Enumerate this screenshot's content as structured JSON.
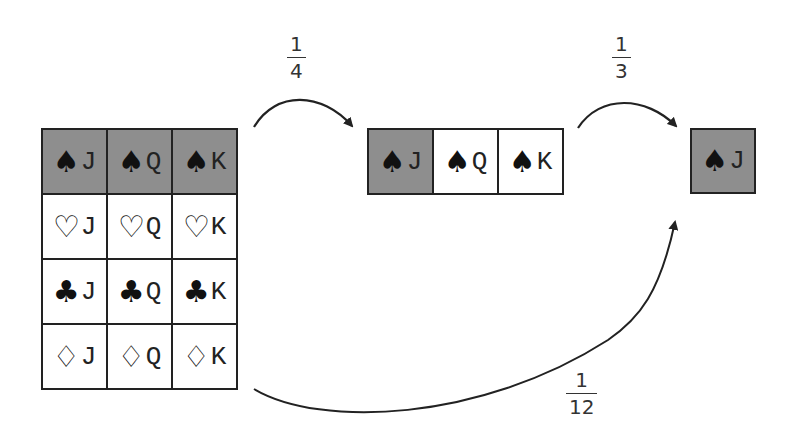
{
  "colors": {
    "highlight": "#8e8e8e",
    "border": "#222222",
    "background": "#ffffff",
    "arrow": "#222222"
  },
  "full_grid": {
    "rows": [
      [
        {
          "suit": "♠",
          "rank": "J",
          "highlight": true
        },
        {
          "suit": "♠",
          "rank": "Q",
          "highlight": true
        },
        {
          "suit": "♠",
          "rank": "K",
          "highlight": true
        }
      ],
      [
        {
          "suit": "♡",
          "rank": "J",
          "highlight": false
        },
        {
          "suit": "♡",
          "rank": "Q",
          "highlight": false
        },
        {
          "suit": "♡",
          "rank": "K",
          "highlight": false
        }
      ],
      [
        {
          "suit": "♣",
          "rank": "J",
          "highlight": false
        },
        {
          "suit": "♣",
          "rank": "Q",
          "highlight": false
        },
        {
          "suit": "♣",
          "rank": "K",
          "highlight": false
        }
      ],
      [
        {
          "suit": "♢",
          "rank": "J",
          "highlight": false
        },
        {
          "suit": "♢",
          "rank": "Q",
          "highlight": false
        },
        {
          "suit": "♢",
          "rank": "K",
          "highlight": false
        }
      ]
    ]
  },
  "spade_row": {
    "cells": [
      {
        "suit": "♠",
        "rank": "J",
        "highlight": true
      },
      {
        "suit": "♠",
        "rank": "Q",
        "highlight": false
      },
      {
        "suit": "♠",
        "rank": "K",
        "highlight": false
      }
    ]
  },
  "result_card": {
    "suit": "♠",
    "rank": "J",
    "highlight": true
  },
  "arrows": [
    {
      "from": "full_grid",
      "to": "spade_row",
      "label": {
        "num": "1",
        "den": "4"
      }
    },
    {
      "from": "spade_row",
      "to": "result_card",
      "label": {
        "num": "1",
        "den": "3"
      }
    },
    {
      "from": "full_grid",
      "to": "result_card",
      "label": {
        "num": "1",
        "den": "12"
      }
    }
  ]
}
